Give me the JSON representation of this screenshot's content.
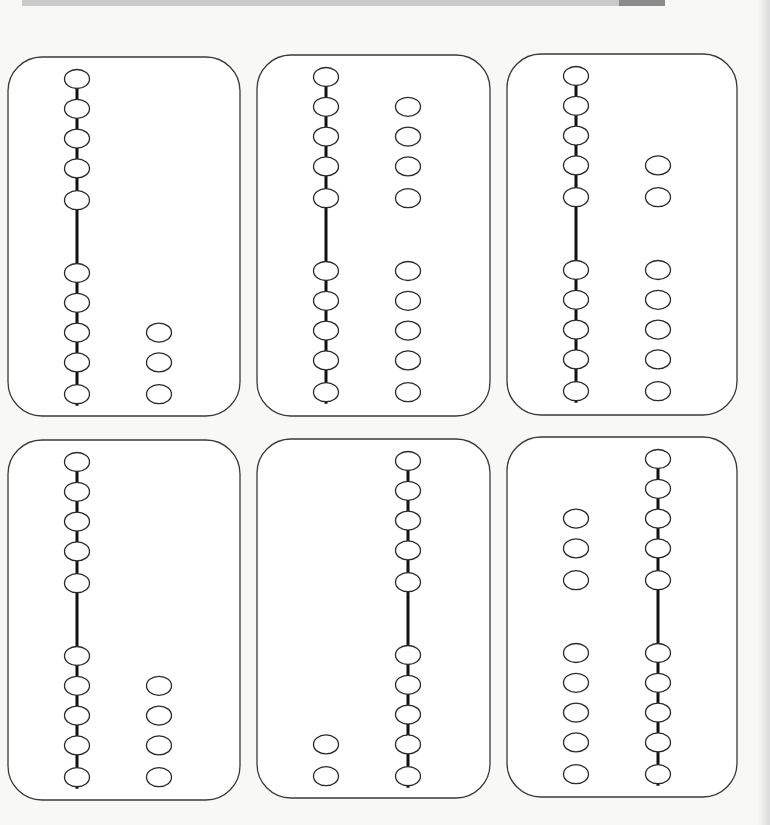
{
  "worksheet": {
    "title": "",
    "cards": [
      {
        "id": 1,
        "strand": {
          "side": "left",
          "upper_beads": 5,
          "lower_beads": 5
        },
        "loose_beads": {
          "side": "right",
          "upper_count": 0,
          "lower_count": 3
        }
      },
      {
        "id": 2,
        "strand": {
          "side": "left",
          "upper_beads": 5,
          "lower_beads": 5
        },
        "loose_beads": {
          "side": "right",
          "upper_count": 4,
          "lower_count": 5
        }
      },
      {
        "id": 3,
        "strand": {
          "side": "left",
          "upper_beads": 5,
          "lower_beads": 5
        },
        "loose_beads": {
          "side": "right",
          "upper_count": 2,
          "lower_count": 5
        }
      },
      {
        "id": 4,
        "strand": {
          "side": "left",
          "upper_beads": 5,
          "lower_beads": 5
        },
        "loose_beads": {
          "side": "right",
          "upper_count": 0,
          "lower_count": 4
        }
      },
      {
        "id": 5,
        "strand": {
          "side": "right",
          "upper_beads": 5,
          "lower_beads": 5
        },
        "loose_beads": {
          "side": "left",
          "upper_count": 0,
          "lower_count": 2
        }
      },
      {
        "id": 6,
        "strand": {
          "side": "right",
          "upper_beads": 5,
          "lower_beads": 5
        },
        "loose_beads": {
          "side": "left",
          "upper_count": 3,
          "lower_count": 5
        }
      }
    ]
  },
  "colors": {
    "background": "#f8f8f7",
    "card_fill": "#ffffff",
    "outline": "#2a2a2a",
    "top_bar": "#c9c9c9",
    "top_bar_dark": "#8b8b8b"
  }
}
